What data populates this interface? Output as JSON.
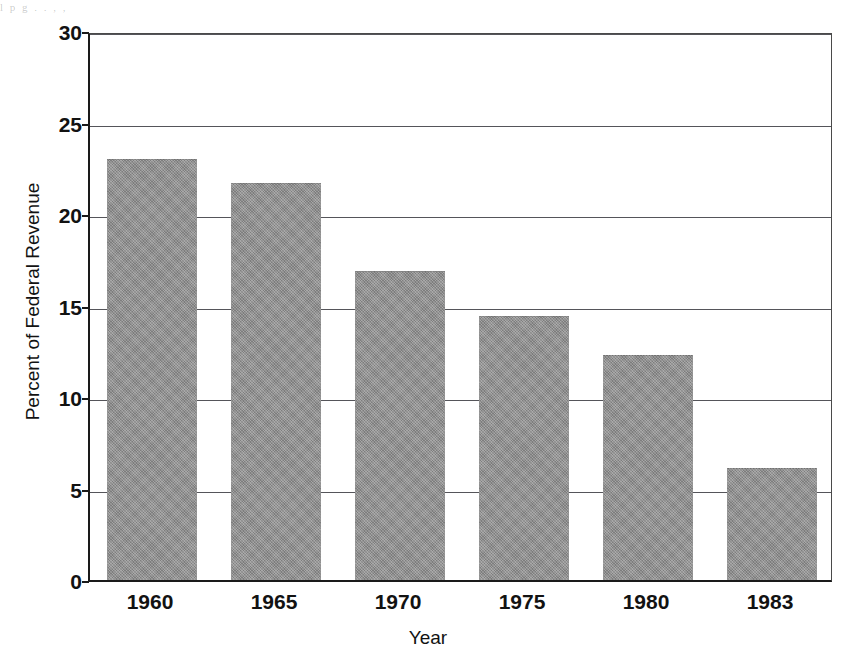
{
  "artifact": {
    "top_strip_text": "l   p  g       .           .                              ,                          ,"
  },
  "chart_data": {
    "type": "bar",
    "title": "",
    "subtitle": "",
    "xlabel": "Year",
    "ylabel": "Percent of Federal Revenue",
    "categories": [
      "1960",
      "1965",
      "1970",
      "1975",
      "1980",
      "1983"
    ],
    "values": [
      23.0,
      21.7,
      16.9,
      14.4,
      12.3,
      6.1
    ],
    "series": [
      {
        "name": "Percent of Federal Revenue",
        "values": [
          23.0,
          21.7,
          16.9,
          14.4,
          12.3,
          6.1
        ]
      }
    ],
    "ylim": [
      0,
      30
    ],
    "yticks": [
      0,
      5,
      10,
      15,
      20,
      25,
      30
    ],
    "ytick_labels": [
      "0",
      "5",
      "10",
      "15",
      "20",
      "25",
      "30"
    ],
    "xtick_labels": [
      "1960",
      "1965",
      "1970",
      "1975",
      "1980",
      "1983"
    ],
    "grid": true,
    "grid_axis": "y",
    "legend": false,
    "legend_position": "none",
    "bar_color": "#8c8c8c",
    "axis_color": "#1a1a1a",
    "gridline_color": "#55555a",
    "background_color": "#ffffff"
  }
}
